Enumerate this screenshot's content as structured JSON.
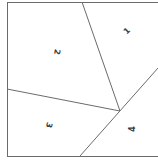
{
  "diagram": {
    "type": "partitioned-square",
    "regions": [
      {
        "id": "1",
        "label": "1",
        "x": 127,
        "y": 31,
        "rotation": -45
      },
      {
        "id": "2",
        "label": "2",
        "x": 57,
        "y": 52,
        "rotation": 100
      },
      {
        "id": "3",
        "label": "3",
        "x": 49,
        "y": 125,
        "rotation": 105
      },
      {
        "id": "4",
        "label": "4",
        "x": 132,
        "y": 129,
        "rotation": -90
      }
    ],
    "stroke_color": "#6b6b6b",
    "label_color": "#3a3a3a"
  }
}
